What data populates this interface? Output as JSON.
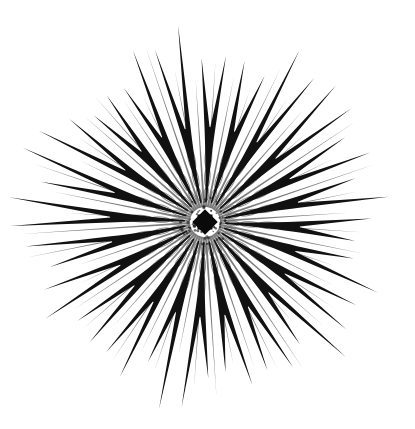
{
  "artwork": {
    "description": "Monochrome radial starburst line art with forked spokes and dense central lattice",
    "background_color": "#ffffff",
    "ink_color": "#111111",
    "center": {
      "x": 205,
      "y": 222
    },
    "main_spokes": {
      "count": 24,
      "rotation_deg": 3,
      "fork_radius": 95,
      "fork_spread_deg": 4.2,
      "inner_radius": 20,
      "tip_radius_min": 150,
      "tip_radius_max": 200,
      "stem_width": 5.5
    },
    "minor_rays": {
      "count": 48,
      "rotation_deg": 0,
      "inner_radius": 15,
      "outer_radius_min": 130,
      "outer_radius_max": 185,
      "width": 1.1,
      "opacity": 0.55
    },
    "lattice": {
      "ring_count": 3,
      "radii": [
        28,
        45,
        65
      ],
      "opacity": 0.5
    },
    "core": {
      "size": 18,
      "rotation_deg": 45,
      "color": "#0a0a0a"
    }
  }
}
